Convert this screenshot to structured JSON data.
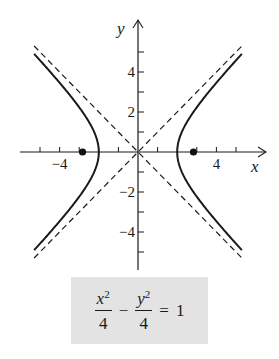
{
  "chart_data": {
    "type": "line",
    "title": "",
    "equation": {
      "x_term": "x",
      "y_term": "y",
      "exponent": "2",
      "x_denominator": "4",
      "y_denominator": "4",
      "minus": "−",
      "equals": "=",
      "rhs": "1"
    },
    "xlabel": "x",
    "ylabel": "y",
    "xlim": [
      -5.8,
      5.9
    ],
    "ylim": [
      -5.9,
      6.6
    ],
    "x_ticks": [
      -5,
      -4,
      -3,
      -1,
      1,
      3,
      4,
      5
    ],
    "x_tick_labels": [
      {
        "value": -4,
        "text": "−4"
      },
      {
        "value": 4,
        "text": "4"
      }
    ],
    "y_ticks": [
      -5,
      -4,
      -3,
      -2,
      -1,
      1,
      2,
      3,
      4,
      5
    ],
    "y_tick_labels": [
      {
        "value": 4,
        "text": "4"
      },
      {
        "value": 2,
        "text": "2"
      },
      {
        "value": -2,
        "text": "−2"
      },
      {
        "value": -4,
        "text": "−4"
      }
    ],
    "series": [
      {
        "name": "hyperbola",
        "a": 2,
        "b": 2,
        "x_range": [
          2,
          5.3
        ],
        "style": "solid"
      },
      {
        "name": "asymptote y=x",
        "slope": 1,
        "x_range": [
          -5.3,
          5.4
        ],
        "style": "dashed"
      },
      {
        "name": "asymptote y=-x",
        "slope": -1,
        "x_range": [
          -5.3,
          5.4
        ],
        "style": "dashed"
      }
    ],
    "points": [
      {
        "name": "focus-left",
        "x": -2.83,
        "y": 0
      },
      {
        "name": "focus-right",
        "x": 2.83,
        "y": 0
      }
    ],
    "grid": false
  }
}
